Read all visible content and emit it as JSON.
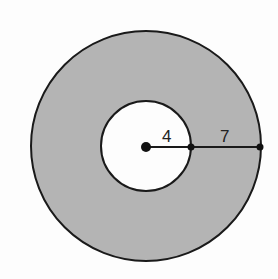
{
  "diagram": {
    "type": "annulus",
    "labels": {
      "inner_radius": "4",
      "outer_segment": "7"
    },
    "colors": {
      "ring_fill": "#b4b4b4",
      "inner_fill": "#fdfdfd",
      "stroke": "#1a1a1a"
    }
  }
}
